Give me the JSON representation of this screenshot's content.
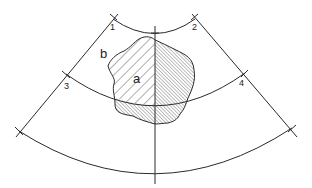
{
  "diagram": {
    "labels": {
      "point_1": "1",
      "point_2": "2",
      "point_3": "3",
      "point_4": "4",
      "region_a": "a",
      "region_b": "b"
    },
    "colors": {
      "stroke": "#2a2a2a",
      "background": "#ffffff"
    }
  }
}
